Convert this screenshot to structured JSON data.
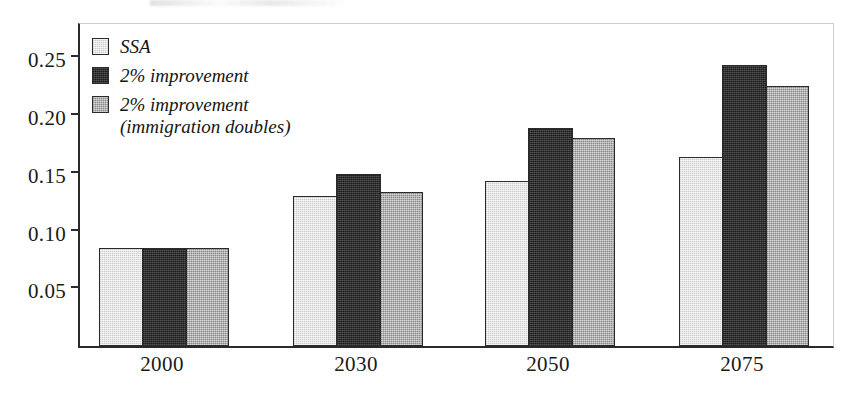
{
  "figure": {
    "background": "#ffffff",
    "frame_color": "#2b2b2b"
  },
  "legend": {
    "position": "upper-left-inside",
    "items": [
      {
        "label": "SSA",
        "color": "#e2e2e2",
        "swatch_name": "legend-swatch-ssa"
      },
      {
        "label": "2% improvement",
        "color": "#2f2f2f",
        "swatch_name": "legend-swatch-improvement"
      },
      {
        "label": "2% improvement\n(immigration doubles)",
        "color": "#b3b3b3",
        "swatch_name": "legend-swatch-improvement-immigration"
      }
    ]
  },
  "axes": {
    "y_ticks": [
      "0.25",
      "0.20",
      "0.15",
      "0.10",
      "0.05"
    ],
    "x_ticks": [
      "2000",
      "2030",
      "2050",
      "2075"
    ]
  },
  "chart_data": {
    "type": "bar",
    "title": "",
    "xlabel": "",
    "ylabel": "",
    "categories": [
      "2000",
      "2030",
      "2050",
      "2075"
    ],
    "series": [
      {
        "name": "SSA",
        "color": "#e2e2e2",
        "values": [
          0.085,
          0.13,
          0.143,
          0.164
        ]
      },
      {
        "name": "2% improvement",
        "color": "#2f2f2f",
        "values": [
          0.085,
          0.149,
          0.189,
          0.243
        ]
      },
      {
        "name": "2% improvement (immigration doubles)",
        "color": "#b3b3b3",
        "values": [
          0.085,
          0.133,
          0.18,
          0.225
        ]
      }
    ],
    "ylim": [
      0.0,
      0.2815
    ],
    "yticks": [
      0.05,
      0.1,
      0.15,
      0.2,
      0.25
    ],
    "grid": false,
    "legend_position": "upper left"
  }
}
